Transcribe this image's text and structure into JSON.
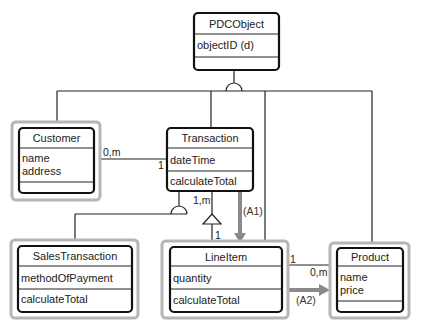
{
  "diagram": {
    "type": "UML class diagram",
    "classes": [
      {
        "name": "PDCObject",
        "attributes": [
          "objectID (d)"
        ],
        "operations": [],
        "highlighted": false
      },
      {
        "name": "Customer",
        "attributes": [
          "name",
          "address"
        ],
        "operations": [],
        "highlighted": true
      },
      {
        "name": "Transaction",
        "attributes": [
          "dateTime"
        ],
        "operations": [
          "calculateTotal"
        ],
        "highlighted": false
      },
      {
        "name": "SalesTransaction",
        "attributes": [
          "methodOfPayment"
        ],
        "operations": [
          "calculateTotal"
        ],
        "highlighted": true
      },
      {
        "name": "LineItem",
        "attributes": [
          "quantity"
        ],
        "operations": [
          "calculateTotal"
        ],
        "highlighted": true
      },
      {
        "name": "Product",
        "attributes": [
          "name",
          "price"
        ],
        "operations": [],
        "highlighted": true
      }
    ],
    "associations": [
      {
        "from": "Customer",
        "to": "Transaction",
        "from_mult": "0,m",
        "to_mult": "1"
      },
      {
        "from": "Transaction",
        "to": "LineItem",
        "from_mult": "1,m",
        "to_mult": "1",
        "kind": "aggregation"
      },
      {
        "from": "LineItem",
        "to": "Product",
        "from_mult": "1",
        "to_mult": "0,m"
      }
    ],
    "generalizations": [
      {
        "parent": "PDCObject",
        "children": [
          "Customer",
          "Transaction",
          "LineItem",
          "Product"
        ]
      },
      {
        "parent": "Transaction",
        "children": [
          "SalesTransaction"
        ]
      }
    ],
    "arrows": [
      {
        "label": "(A1)",
        "from": "Transaction",
        "to": "LineItem",
        "color": "#8a8a8a"
      },
      {
        "label": "(A2)",
        "from": "LineItem",
        "to": "Product",
        "color": "#8a8a8a"
      }
    ]
  },
  "labels": {
    "cust_trans_from": "0,m",
    "cust_trans_to": "1",
    "trans_line_from": "1,m",
    "trans_line_to": "1",
    "line_prod_from": "1",
    "line_prod_to": "0,m",
    "a1": "(A1)",
    "a2": "(A2)"
  },
  "colors": {
    "box_border": "#111111",
    "highlight_border": "#b5b5b5",
    "arrow": "#8a8a8a"
  }
}
